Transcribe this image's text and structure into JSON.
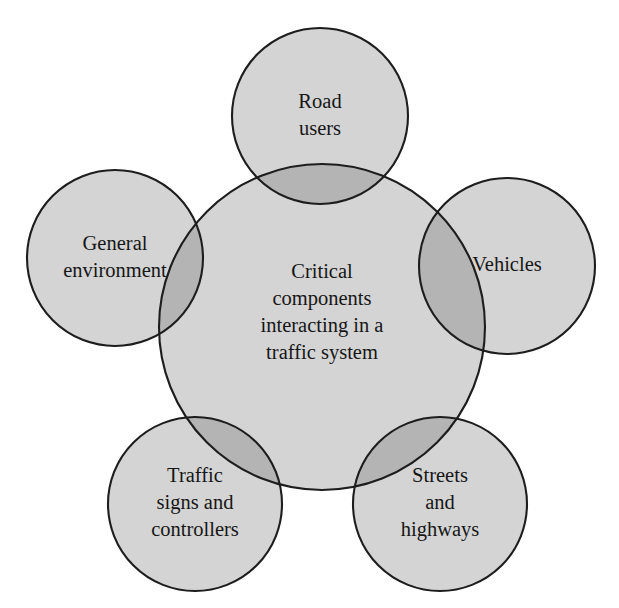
{
  "diagram": {
    "type": "venn-cluster",
    "colors": {
      "circle_fill": "#d4d4d4",
      "overlap_fill": "#b4b4b4",
      "outline": "#1d1d1d",
      "text": "#161616",
      "background": "#ffffff"
    },
    "center": {
      "name": "critical-components",
      "lines": [
        "Critical",
        "components",
        "interacting in a",
        "traffic system"
      ],
      "cx": 322,
      "cy": 327,
      "r": 163
    },
    "satellites": [
      {
        "name": "road-users",
        "lines": [
          "Road",
          "users"
        ],
        "cx": 320,
        "cy": 116,
        "r": 88
      },
      {
        "name": "general-environment",
        "lines": [
          "General",
          "environment"
        ],
        "cx": 115,
        "cy": 258,
        "r": 88
      },
      {
        "name": "vehicles",
        "lines": [
          "Vehicles"
        ],
        "cx": 507,
        "cy": 266,
        "r": 88
      },
      {
        "name": "traffic-signs-and-controllers",
        "lines": [
          "Traffic",
          "signs and",
          "controllers"
        ],
        "cx": 195,
        "cy": 504,
        "r": 87
      },
      {
        "name": "streets-and-highways",
        "lines": [
          "Streets",
          "and",
          "highways"
        ],
        "cx": 440,
        "cy": 504,
        "r": 87
      }
    ]
  }
}
